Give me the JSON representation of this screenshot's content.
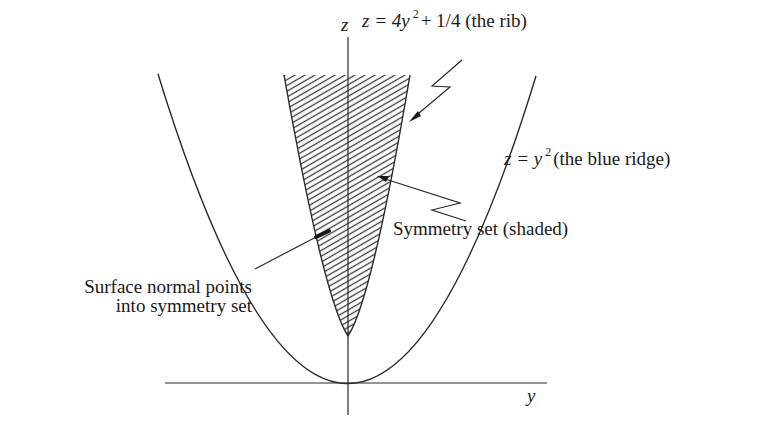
{
  "figure": {
    "axes": {
      "vertical_label": "z",
      "horizontal_label": "y"
    },
    "labels": {
      "rib": {
        "prefix": "z =  4y",
        "exponent": "2",
        "suffix": "+  1/4 (the rib)"
      },
      "ridge": {
        "prefix": "z =  y",
        "exponent": "2",
        "suffix": "(the blue ridge)"
      },
      "symmetry_set": "Symmetry set (shaded)",
      "surface_normal_line1": "Surface normal points",
      "surface_normal_line2": "into symmetry set"
    },
    "curves": [
      {
        "name": "ridge",
        "equation": "z = y^2"
      },
      {
        "name": "rib",
        "equation": "z = 4y^2 + 1/4"
      }
    ],
    "colors": {
      "line": "#2a2a2a",
      "hatch": "#3a3a3a",
      "background": "#ffffff"
    }
  }
}
